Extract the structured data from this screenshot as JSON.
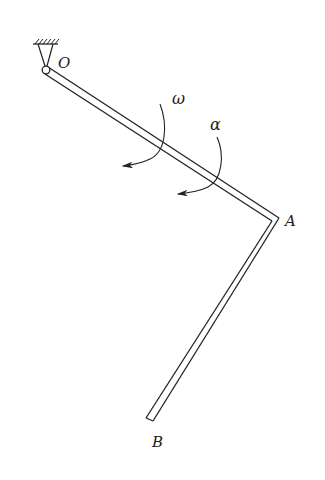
{
  "diagram": {
    "title": "",
    "labels": {
      "pivot": "O",
      "corner": "A",
      "end": "B",
      "angular_velocity": "ω",
      "angular_acceleration": "α"
    },
    "components": [
      {
        "name": "fixed-support",
        "type": "ground-hatch-with-pin"
      },
      {
        "name": "rod-OA",
        "from": "O",
        "to": "A"
      },
      {
        "name": "rod-AB",
        "from": "A",
        "to": "B"
      },
      {
        "name": "omega-arrow",
        "label": "ω",
        "direction": "clockwise"
      },
      {
        "name": "alpha-arrow",
        "label": "α",
        "direction": "clockwise"
      }
    ],
    "colors": {
      "stroke": "#222222",
      "background": "#ffffff"
    }
  }
}
